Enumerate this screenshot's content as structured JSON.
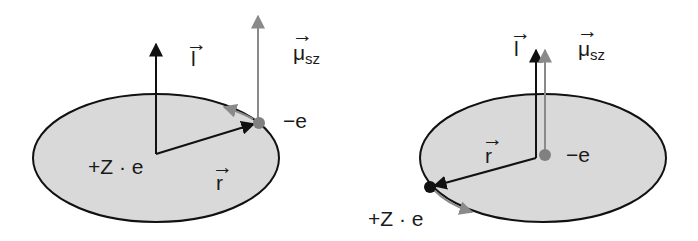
{
  "diagram": {
    "colors": {
      "disk_fill": "#d9d9d9",
      "disk_stroke": "#111111",
      "black_vector": "#111111",
      "gray_vector": "#8a8a8a",
      "electron": "#808080",
      "nucleus": "#111111"
    },
    "left_panel": {
      "angular_momentum_label": "l",
      "magnetic_moment_label": "μ",
      "magnetic_moment_sub": "sz",
      "nucleus_label": "+Z · e",
      "electron_label": "−e",
      "radius_label": "r"
    },
    "right_panel": {
      "angular_momentum_label": "l",
      "magnetic_moment_label": "μ",
      "magnetic_moment_sub": "sz",
      "nucleus_label": "+Z · e",
      "electron_label": "−e",
      "radius_label": "r"
    }
  }
}
